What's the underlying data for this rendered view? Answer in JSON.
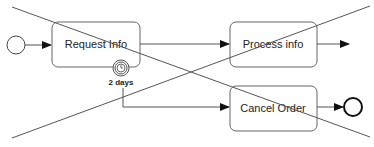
{
  "diagram": {
    "type": "BPMN process",
    "start_event": {
      "label": ""
    },
    "tasks": [
      {
        "id": "request-info",
        "label": "Request Info"
      },
      {
        "id": "process-info",
        "label": "Process info"
      },
      {
        "id": "cancel-order",
        "label": "Cancel Order"
      }
    ],
    "timer_boundary_event": {
      "label": "2 days"
    },
    "end_event": {
      "label": ""
    },
    "flows": [
      {
        "from": "start",
        "to": "request-info"
      },
      {
        "from": "request-info",
        "to": "process-info"
      },
      {
        "from": "process-info",
        "to": "(outgoing)"
      },
      {
        "from": "timer",
        "to": "cancel-order"
      },
      {
        "from": "cancel-order",
        "to": "end"
      }
    ],
    "overlay": "crossed-out (large X)"
  }
}
